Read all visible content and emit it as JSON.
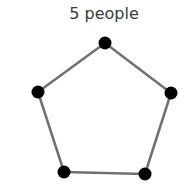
{
  "title": "5 people",
  "graph": {
    "edge_color": "#707070",
    "node_color": "#000000",
    "nodes": [
      {
        "id": 1,
        "x": 105,
        "y": 43
      },
      {
        "id": 2,
        "x": 171,
        "y": 93
      },
      {
        "id": 3,
        "x": 145,
        "y": 174
      },
      {
        "id": 4,
        "x": 64,
        "y": 172
      },
      {
        "id": 5,
        "x": 38,
        "y": 92
      }
    ],
    "edges": [
      [
        1,
        2
      ],
      [
        2,
        3
      ],
      [
        3,
        4
      ],
      [
        4,
        5
      ],
      [
        5,
        1
      ]
    ]
  }
}
